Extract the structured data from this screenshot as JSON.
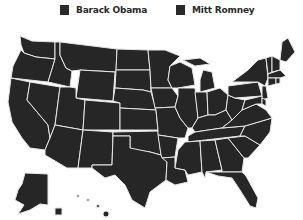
{
  "legend": {
    "items": [
      {
        "label": "Barack Obama",
        "color": "#2a2a2a"
      },
      {
        "label": "Mitt Romney",
        "color": "#2a2a2a"
      }
    ]
  },
  "map": {
    "title": "United States electoral map",
    "fill_color": "#262626",
    "border_color": "#e6e6e6",
    "background": "#ffffff",
    "regions": [
      "WA",
      "OR",
      "CA",
      "ID",
      "NV",
      "MT",
      "WY",
      "UT",
      "AZ",
      "CO",
      "NM",
      "ND",
      "SD",
      "NE",
      "KS",
      "OK",
      "TX",
      "MN",
      "IA",
      "MO",
      "AR",
      "LA",
      "WI",
      "IL",
      "MI",
      "IN",
      "OH",
      "KY",
      "TN",
      "MS",
      "AL",
      "GA",
      "FL",
      "SC",
      "NC",
      "VA",
      "WV",
      "PA",
      "NY",
      "ME",
      "VT",
      "NH",
      "MA",
      "NJ",
      "MD",
      "DE",
      "CT",
      "RI",
      "AK",
      "HI"
    ]
  }
}
